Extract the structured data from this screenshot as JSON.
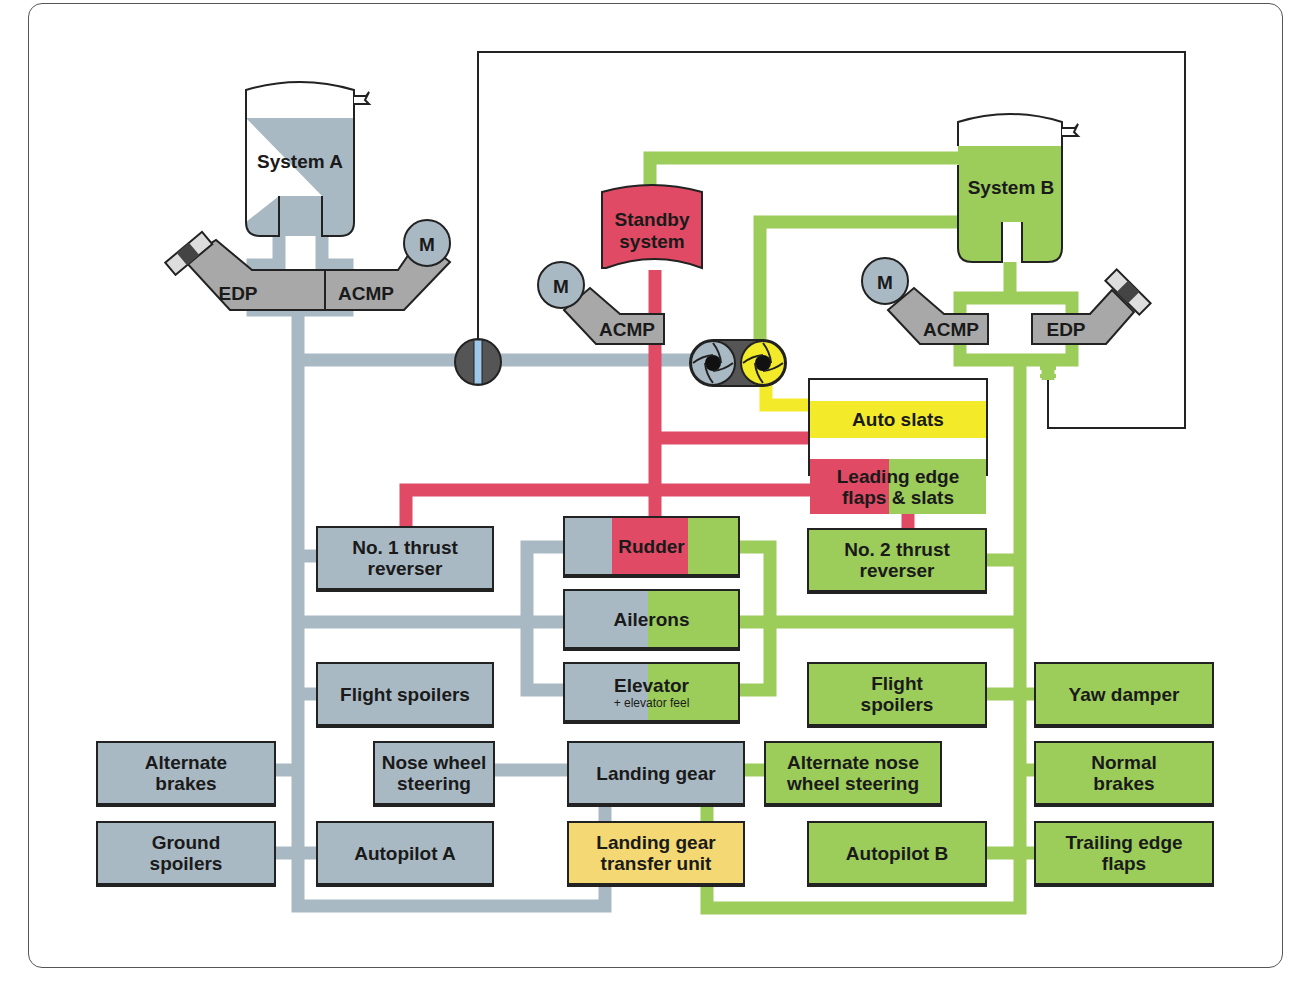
{
  "diagram": {
    "title": "",
    "colors": {
      "system_a": "#a9b9c4",
      "system_b": "#9ccc5a",
      "standby": "#e04a64",
      "auto_slats": "#f3ea2a",
      "transfer_unit": "#f3d873",
      "pump_gray": "#a8a8a8"
    },
    "reservoirs": {
      "system_a": "System A",
      "system_b": "System B",
      "standby": "Standby\nsystem"
    },
    "pumps": {
      "a_edp": "EDP",
      "a_acmp": "ACMP",
      "a_motor": "M",
      "standby_acmp": "ACMP",
      "standby_motor": "M",
      "b_acmp": "ACMP",
      "b_motor": "M",
      "b_edp": "EDP"
    },
    "components": {
      "auto_slats": "Auto slats",
      "leading_edge": "Leading edge\nflaps & slats",
      "thrust_rev_1": "No. 1 thrust\nreverser",
      "rudder": "Rudder",
      "thrust_rev_2": "No. 2 thrust\nreverser",
      "ailerons": "Ailerons",
      "elevator": "Elevator",
      "elevator_sub": "+ elevator feel",
      "flight_spoilers_a": "Flight spoilers",
      "flight_spoilers_b": "Flight\nspoilers",
      "yaw_damper": "Yaw damper",
      "alternate_brakes": "Alternate\nbrakes",
      "nose_wheel_steering": "Nose wheel\nsteering",
      "landing_gear": "Landing gear",
      "alt_nose_wheel_steering": "Alternate nose\nwheel steering",
      "normal_brakes": "Normal\nbrakes",
      "ground_spoilers": "Ground\nspoilers",
      "autopilot_a": "Autopilot A",
      "landing_gear_transfer": "Landing gear\ntransfer unit",
      "autopilot_b": "Autopilot B",
      "trailing_edge_flaps": "Trailing edge\nflaps"
    }
  }
}
